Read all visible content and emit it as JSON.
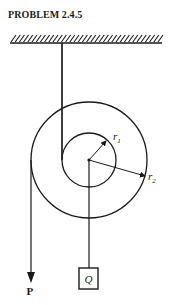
{
  "title": "PROBLEM 2.4.5",
  "labels": {
    "r1": {
      "main": "r",
      "sub": "1"
    },
    "r2": {
      "main": "r",
      "sub": "2"
    },
    "force": "P",
    "weight": "Q"
  },
  "colors": {
    "ink": "#1a1a1a",
    "background": "#ffffff"
  }
}
